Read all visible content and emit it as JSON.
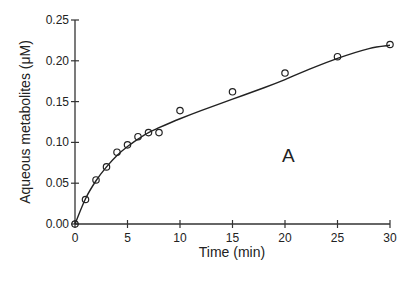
{
  "chart_data": {
    "type": "scatter",
    "title": "",
    "panel_label": "A",
    "xlabel": "Time (min)",
    "ylabel": "Aqueous metabolites (μM)",
    "xlim": [
      0,
      30
    ],
    "ylim": [
      0,
      0.25
    ],
    "x_ticks": [
      0,
      5,
      10,
      15,
      20,
      25,
      30
    ],
    "x_tick_labels": [
      "0",
      "5",
      "10",
      "15",
      "20",
      "25",
      "30"
    ],
    "y_ticks": [
      0,
      0.05,
      0.1,
      0.15,
      0.2,
      0.25
    ],
    "y_tick_labels": [
      "0.00",
      "0.05",
      "0.10",
      "0.15",
      "0.20",
      "0.25"
    ],
    "grid": false,
    "legend": null,
    "series": [
      {
        "name": "Aqueous metabolites",
        "marker": "open-circle",
        "x": [
          0,
          1,
          2,
          3,
          4,
          5,
          6,
          7,
          8,
          10,
          15,
          20,
          25,
          30
        ],
        "y": [
          0.0,
          0.03,
          0.054,
          0.07,
          0.088,
          0.097,
          0.107,
          0.112,
          0.112,
          0.139,
          0.162,
          0.185,
          0.205,
          0.22
        ]
      },
      {
        "name": "Fitted curve",
        "marker": "none",
        "style": "solid-line",
        "x": [
          0,
          1,
          2,
          3,
          4,
          5,
          6,
          7,
          8,
          10,
          12,
          15,
          18,
          20,
          22,
          25,
          28,
          30
        ],
        "y": [
          0.0,
          0.031,
          0.053,
          0.07,
          0.084,
          0.095,
          0.104,
          0.112,
          0.118,
          0.129,
          0.139,
          0.153,
          0.167,
          0.177,
          0.188,
          0.203,
          0.215,
          0.219
        ]
      }
    ]
  }
}
